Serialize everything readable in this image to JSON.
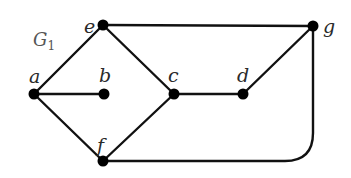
{
  "graph": {
    "title": "G",
    "title_subscript": "1",
    "vertices": [
      {
        "id": "a",
        "label": "a"
      },
      {
        "id": "b",
        "label": "b"
      },
      {
        "id": "c",
        "label": "c"
      },
      {
        "id": "d",
        "label": "d"
      },
      {
        "id": "e",
        "label": "e"
      },
      {
        "id": "f",
        "label": "f"
      },
      {
        "id": "g",
        "label": "g"
      }
    ],
    "edges": [
      [
        "a",
        "e"
      ],
      [
        "a",
        "b"
      ],
      [
        "a",
        "f"
      ],
      [
        "e",
        "c"
      ],
      [
        "e",
        "g"
      ],
      [
        "c",
        "d"
      ],
      [
        "c",
        "f"
      ],
      [
        "d",
        "g"
      ],
      [
        "f",
        "g"
      ]
    ],
    "edge_color": "#111111",
    "vertex_color": "#000000"
  }
}
